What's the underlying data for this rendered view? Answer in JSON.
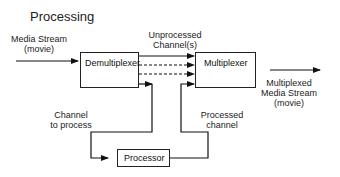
{
  "title": "Processing",
  "input_label": [
    "Media Stream",
    "(movie)"
  ],
  "unprocessed_label": [
    "Unprocessed",
    "Channel(s)"
  ],
  "output_label": [
    "Multiplexed",
    "Media Stream",
    "(movie)"
  ],
  "channel_to_process_label": [
    "Channel",
    "to process"
  ],
  "processed_channel_label": [
    "Processed",
    "channel"
  ],
  "boxes": {
    "demultiplexer": "Demultiplexer",
    "multiplexer": "Multiplexer",
    "processor": "Processor"
  }
}
